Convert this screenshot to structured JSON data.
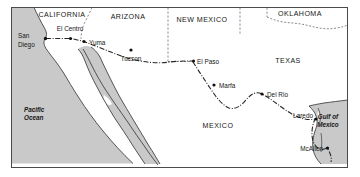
{
  "figure": {
    "kind": "reference-map",
    "frame": {
      "stroke": "#4a4a4a",
      "fill": "#ffffff"
    }
  },
  "colors": {
    "land_fill": "#c9c9c9",
    "water_fill": "#ffffff",
    "coastline": "#3a3a3a",
    "state_border": "#6e6e6e",
    "international_border": "#262626",
    "text": "#161616",
    "frame": "#4a4a4a"
  },
  "regions": [
    {
      "id": "california",
      "label": "CALIFORNIA",
      "type": "state",
      "x": 62,
      "y": 17
    },
    {
      "id": "arizona",
      "label": "ARIZONA",
      "type": "state",
      "x": 128,
      "y": 19
    },
    {
      "id": "new-mexico",
      "label": "NEW MEXICO",
      "type": "state",
      "x": 198,
      "y": 22
    },
    {
      "id": "oklahoma",
      "label": "OKLAHOMA",
      "type": "state",
      "x": 293,
      "y": 16
    },
    {
      "id": "texas",
      "label": "TEXAS",
      "type": "state",
      "x": 275,
      "y": 63
    },
    {
      "id": "mexico",
      "label": "MEXICO",
      "type": "country",
      "x": 197,
      "y": 128
    }
  ],
  "water_bodies": [
    {
      "id": "pacific-ocean",
      "lines": [
        "Pacific",
        "Ocean"
      ],
      "x": 24,
      "y": 112
    },
    {
      "id": "gulf-of-mexico",
      "lines": [
        "Gulf of",
        "Mexico"
      ],
      "x": 322,
      "y": 119
    }
  ],
  "cities": [
    {
      "id": "san-diego",
      "label": "San\nDiego",
      "line1": "San",
      "line2": "Diego",
      "dot_x": 45.5,
      "dot_y": 38.5,
      "label_x": 18,
      "label_y": 38,
      "anchor": "start",
      "two_line": true
    },
    {
      "id": "el-centro",
      "label": "El Centro",
      "dot_x": 70.5,
      "dot_y": 38.5,
      "label_x": 70,
      "label_y": 31,
      "anchor": "middle",
      "two_line": false
    },
    {
      "id": "yuma",
      "label": "Yuma",
      "dot_x": 83.5,
      "dot_y": 41.5,
      "label_x": 89,
      "label_y": 45,
      "anchor": "start",
      "two_line": false
    },
    {
      "id": "tucson",
      "label": "Tucson",
      "dot_x": 131,
      "dot_y": 50,
      "label_x": 131,
      "label_y": 61,
      "anchor": "middle",
      "two_line": false
    },
    {
      "id": "el-paso",
      "label": "El Paso",
      "dot_x": 193,
      "dot_y": 61,
      "label_x": 197,
      "label_y": 63.5,
      "anchor": "start",
      "two_line": false
    },
    {
      "id": "marfa",
      "label": "Marfa",
      "dot_x": 214,
      "dot_y": 85,
      "label_x": 219,
      "label_y": 87.5,
      "anchor": "start",
      "two_line": false
    },
    {
      "id": "del-rio",
      "label": "Del Rio",
      "dot_x": 262,
      "dot_y": 94,
      "label_x": 267,
      "label_y": 96.5,
      "anchor": "start",
      "two_line": false
    },
    {
      "id": "laredo",
      "label": "Laredo",
      "dot_x": 316,
      "dot_y": 119,
      "label_x": 313,
      "label_y": 118,
      "anchor": "end",
      "two_line": false
    },
    {
      "id": "mcallen",
      "label": "McAllen",
      "dot_x": 327,
      "dot_y": 148,
      "label_x": 323,
      "label_y": 151,
      "anchor": "end",
      "two_line": false
    }
  ],
  "border_style": {
    "international": "dash-dot",
    "state": "dashed"
  }
}
